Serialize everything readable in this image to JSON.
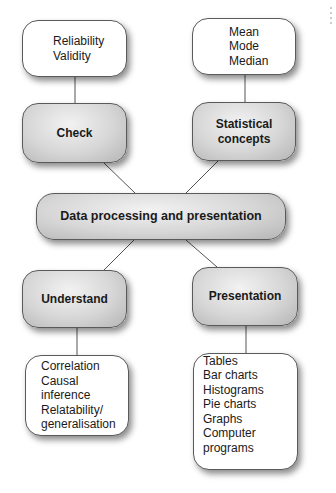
{
  "diagram": {
    "center": {
      "label": "Data processing and presentation"
    },
    "branches": [
      {
        "id": "check",
        "label": "Check",
        "items": [
          "Reliability",
          "Validity"
        ]
      },
      {
        "id": "statistical-concepts",
        "label": "Statistical concepts",
        "label_lines": [
          "Statistical",
          "concepts"
        ],
        "items": [
          "Mean",
          "Mode",
          "Median"
        ]
      },
      {
        "id": "understand",
        "label": "Understand",
        "items": [
          "Correlation",
          "Causal inference",
          "Relatability/",
          "generalisation"
        ]
      },
      {
        "id": "presentation",
        "label": "Presentation",
        "items": [
          "Tables",
          "Bar charts",
          "Histograms",
          "Pie charts",
          "Graphs",
          "Computer programs"
        ]
      }
    ]
  },
  "colors": {
    "box_grey": "#cfcfcf",
    "line": "#555555",
    "text": "#1a1a1a"
  }
}
